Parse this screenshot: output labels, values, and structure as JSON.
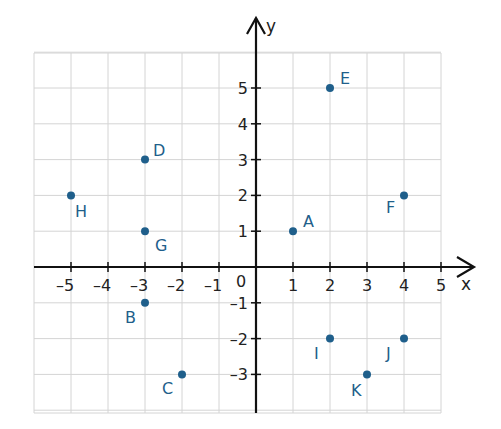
{
  "chart_data": {
    "type": "scatter",
    "title": "",
    "xlabel": "x",
    "ylabel": "y",
    "xlim": [
      -6,
      5
    ],
    "ylim": [
      -4,
      6
    ],
    "grid": true,
    "x_ticks": [
      -5,
      -4,
      -3,
      -2,
      -1,
      1,
      2,
      3,
      4,
      5
    ],
    "y_ticks": [
      -3,
      -2,
      -1,
      1,
      2,
      3,
      4,
      5
    ],
    "origin_label": "0",
    "point_color": "#1f5f8b",
    "points": [
      {
        "label": "A",
        "x": 1,
        "y": 1,
        "dx": 10,
        "dy": -4
      },
      {
        "label": "B",
        "x": -3,
        "y": -1,
        "dx": -20,
        "dy": 20
      },
      {
        "label": "C",
        "x": -2,
        "y": -3,
        "dx": -20,
        "dy": 20
      },
      {
        "label": "D",
        "x": -3,
        "y": 3,
        "dx": 8,
        "dy": -4
      },
      {
        "label": "E",
        "x": 2,
        "y": 5,
        "dx": 10,
        "dy": -4
      },
      {
        "label": "F",
        "x": 4,
        "y": 2,
        "dx": -18,
        "dy": 18
      },
      {
        "label": "G",
        "x": -3,
        "y": 1,
        "dx": 10,
        "dy": 20
      },
      {
        "label": "H",
        "x": -5,
        "y": 2,
        "dx": 4,
        "dy": 22
      },
      {
        "label": "I",
        "x": 2,
        "y": -2,
        "dx": -16,
        "dy": 20
      },
      {
        "label": "J",
        "x": 4,
        "y": -2,
        "dx": -18,
        "dy": 20
      },
      {
        "label": "K",
        "x": 3,
        "y": -3,
        "dx": -16,
        "dy": 22
      }
    ]
  }
}
